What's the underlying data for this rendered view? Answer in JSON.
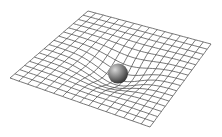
{
  "diagram": {
    "grid": {
      "rows": 16,
      "cols": 16,
      "line_color": "#555555",
      "background": "#ffffff",
      "corners": {
        "back": [
          88,
          11
        ],
        "left": [
          10,
          78
        ],
        "right": [
          211,
          44
        ],
        "front": [
          150,
          127
        ]
      }
    },
    "mass": {
      "shape": "sphere",
      "center": [
        118,
        68
      ],
      "radius": 10,
      "color_light": "#bdbdbd",
      "color_dark": "#3a3a3a"
    },
    "well_depth": 14
  }
}
